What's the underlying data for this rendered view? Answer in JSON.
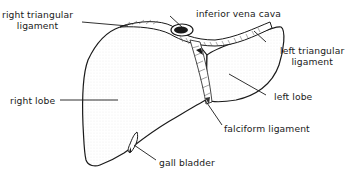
{
  "diagram": {
    "labels": [
      {
        "id": "right-triangular-ligament",
        "line1": "right triangular",
        "line2": "ligament"
      },
      {
        "id": "inferior-vena-cava",
        "line1": "inferior vena cava"
      },
      {
        "id": "left-triangular-ligament",
        "line1": "left triangular",
        "line2": "ligament"
      },
      {
        "id": "right-lobe",
        "line1": "right lobe"
      },
      {
        "id": "left-lobe",
        "line1": "left lobe"
      },
      {
        "id": "falciform-ligament",
        "line1": "falciform ligament"
      },
      {
        "id": "gall-bladder",
        "line1": "gall bladder"
      }
    ]
  }
}
